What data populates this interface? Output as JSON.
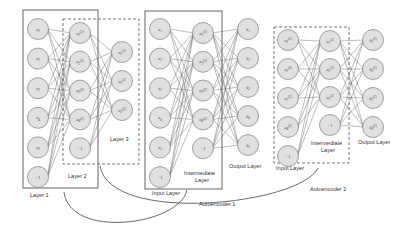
{
  "blocks": [
    {
      "name": "full-network",
      "layers": [
        {
          "label": "Layer 1",
          "nodes": [
            "x1",
            "x2",
            "x3",
            "x4",
            "x5",
            "+1"
          ]
        },
        {
          "label": "Layer 2",
          "nodes": [
            "a1(2)",
            "a2(2)",
            "a3(2)",
            "a4(2)",
            "+1"
          ]
        },
        {
          "label": "Layer 3",
          "nodes": [
            "a1(3)",
            "a2(3)",
            "a3(3)"
          ]
        }
      ]
    },
    {
      "name": "autoencoder-1",
      "caption": "Autoencoder 1",
      "layers": [
        {
          "label": "Input Layer",
          "nodes": [
            "x1",
            "x2",
            "x3",
            "x4",
            "x5",
            "+1"
          ]
        },
        {
          "label": "Intermediate Layer",
          "nodes": [
            "a1(2)",
            "a2(2)",
            "a3(2)",
            "a4(2)",
            "+1"
          ]
        },
        {
          "label": "Output Layer",
          "nodes": [
            "x̂1",
            "x̂2",
            "x̂3",
            "x̂4",
            "x̂5"
          ]
        }
      ]
    },
    {
      "name": "autoencoder-2",
      "caption": "Autoencoder 2",
      "layers": [
        {
          "label": "Input Layer",
          "nodes": [
            "a1(2)",
            "a2(2)",
            "a3(2)",
            "a4(2)",
            "+1"
          ]
        },
        {
          "label": "Intermediate Layer",
          "nodes": [
            "a1(3)",
            "a2(3)",
            "a3(3)",
            "+1"
          ]
        },
        {
          "label": "Output Layer",
          "nodes": [
            "â1(2)",
            "â2(2)",
            "â3(2)",
            "â4(2)"
          ]
        }
      ]
    }
  ],
  "labels": {
    "layer1": "Layer 1",
    "layer2": "Layer 2",
    "layer3": "Layer 3",
    "ae1_input": "Input Layer",
    "ae1_intermediate_1": "Intermediate",
    "ae1_intermediate_2": "Layer",
    "ae1_output": "Output Layer",
    "ae1_caption": "Autoencoder 1",
    "ae2_input": "Input Layer",
    "ae2_intermediate_1": "Intermediate",
    "ae2_intermediate_2": "Layer",
    "ae2_output": "Output Layer",
    "ae2_caption": "Autoencoder 2"
  },
  "colors": {
    "node_fill": "#e0e0e0",
    "node_stroke": "#8a8a8a",
    "edge": "#555555",
    "box": "#555555"
  }
}
